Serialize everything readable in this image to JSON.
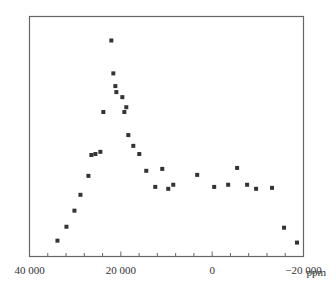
{
  "chart_data": {
    "type": "scatter",
    "title": "",
    "xlabel": "ppm",
    "ylabel": "",
    "xlim": [
      40000,
      -20000
    ],
    "ylim": [
      0,
      100
    ],
    "x_reversed": true,
    "grid": false,
    "legend": null,
    "x_ticks": [
      {
        "value": 40000,
        "label": "40 000"
      },
      {
        "value": 20000,
        "label": "20 000"
      },
      {
        "value": 0,
        "label": "0"
      },
      {
        "value": -20000,
        "label": "−20 000"
      }
    ],
    "x_minor_tick_step": 4000,
    "marker": "square",
    "marker_color": "#333333",
    "series": [
      {
        "name": "spectrum",
        "points": [
          {
            "x": 33880,
            "y": 6.6
          },
          {
            "x": 31910,
            "y": 12.4
          },
          {
            "x": 30160,
            "y": 19.1
          },
          {
            "x": 28850,
            "y": 25.7
          },
          {
            "x": 27100,
            "y": 33.6
          },
          {
            "x": 26450,
            "y": 42.3
          },
          {
            "x": 25570,
            "y": 42.7
          },
          {
            "x": 24480,
            "y": 43.6
          },
          {
            "x": 23830,
            "y": 60.2
          },
          {
            "x": 22080,
            "y": 90.0
          },
          {
            "x": 21640,
            "y": 76.3
          },
          {
            "x": 21200,
            "y": 71.0
          },
          {
            "x": 20980,
            "y": 68.5
          },
          {
            "x": 19670,
            "y": 66.4
          },
          {
            "x": 19230,
            "y": 60.2
          },
          {
            "x": 18800,
            "y": 62.2
          },
          {
            "x": 18360,
            "y": 50.6
          },
          {
            "x": 17270,
            "y": 46.1
          },
          {
            "x": 15960,
            "y": 42.7
          },
          {
            "x": 14430,
            "y": 35.7
          },
          {
            "x": 12460,
            "y": 29.0
          },
          {
            "x": 10930,
            "y": 36.5
          },
          {
            "x": 9620,
            "y": 28.2
          },
          {
            "x": 8520,
            "y": 29.9
          },
          {
            "x": 3280,
            "y": 34.0
          },
          {
            "x": -440,
            "y": 29.0
          },
          {
            "x": -3500,
            "y": 29.9
          },
          {
            "x": -5460,
            "y": 36.9
          },
          {
            "x": -7650,
            "y": 29.9
          },
          {
            "x": -9620,
            "y": 28.2
          },
          {
            "x": -13110,
            "y": 28.6
          },
          {
            "x": -15740,
            "y": 12.0
          },
          {
            "x": -18580,
            "y": 5.8
          }
        ]
      }
    ]
  }
}
